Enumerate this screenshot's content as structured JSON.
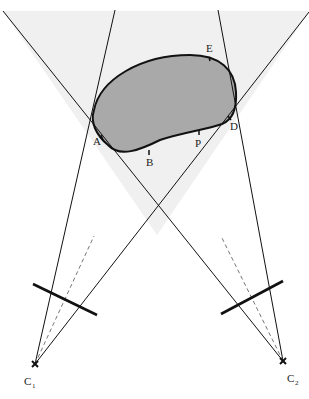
{
  "diagram": {
    "colors": {
      "background": "#ffffff",
      "shaded_region": "#f0f0f0",
      "object_fill": "#a9a9a9",
      "stroke": "#111111",
      "dashed": "#777777"
    },
    "points": {
      "A": {
        "label": "A"
      },
      "B": {
        "label": "B"
      },
      "P": {
        "label": "P"
      },
      "D": {
        "label": "D"
      },
      "E": {
        "label": "E"
      }
    },
    "cameras": [
      {
        "label": "C",
        "subscript": "1"
      },
      {
        "label": "C",
        "subscript": "2"
      }
    ]
  }
}
